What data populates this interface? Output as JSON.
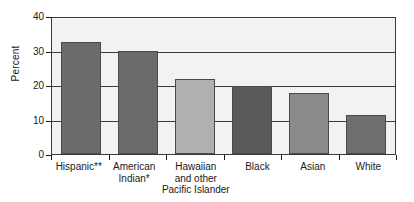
{
  "chart_data": {
    "type": "bar",
    "title": "",
    "xlabel": "",
    "ylabel": "Percent",
    "ylim": [
      0,
      40
    ],
    "yticks": [
      0,
      10,
      20,
      30,
      40
    ],
    "grid": true,
    "legend": false,
    "categories": [
      "Hispanic**",
      "American Indian*",
      "Hawaiian and other Pacific Islander",
      "Black",
      "Asian",
      "White"
    ],
    "values": [
      32.6,
      30.0,
      21.8,
      19.6,
      17.7,
      11.2
    ],
    "bar_colors": [
      "#6b6b6b",
      "#6b6b6b",
      "#b0b0b0",
      "#5a5a5a",
      "#8a8a8a",
      "#6e6e6e"
    ]
  },
  "axis": {
    "y_title": "Percent",
    "y_tick_labels": [
      "40",
      "30",
      "20",
      "10",
      "0"
    ]
  },
  "x_labels": [
    {
      "lines": [
        "Hispanic**"
      ]
    },
    {
      "lines": [
        "American",
        "Indian*"
      ]
    },
    {
      "lines": [
        "Hawaiian",
        "and other",
        "Pacific Islander"
      ]
    },
    {
      "lines": [
        "Black"
      ]
    },
    {
      "lines": [
        "Asian"
      ]
    },
    {
      "lines": [
        "White"
      ]
    }
  ],
  "colors": {
    "plot_background": "#f2f2f2",
    "axis_line": "#3a3a3a",
    "text": "#1a1a1a",
    "page_background": "#ffffff"
  }
}
